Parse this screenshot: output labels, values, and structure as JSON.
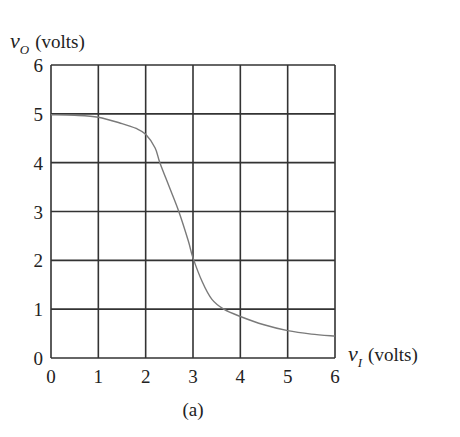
{
  "chart_data": {
    "type": "line",
    "title": "",
    "caption": "(a)",
    "xlabel": {
      "var": "v",
      "sub": "I",
      "unit": "(volts)"
    },
    "ylabel": {
      "var": "v",
      "sub": "O",
      "unit": "(volts)"
    },
    "xlim": [
      0,
      6
    ],
    "ylim": [
      0,
      6
    ],
    "xticks": [
      "0",
      "1",
      "2",
      "3",
      "4",
      "5",
      "6"
    ],
    "yticks": [
      "0",
      "1",
      "2",
      "3",
      "4",
      "5",
      "6"
    ],
    "grid": true,
    "legend": null,
    "series": [
      {
        "name": "v_O vs v_I",
        "color": "#7a7a7a",
        "x": [
          0.0,
          0.5,
          1.0,
          1.5,
          1.8,
          2.0,
          2.2,
          2.3,
          2.5,
          2.7,
          2.9,
          3.0,
          3.2,
          3.4,
          3.65,
          4.0,
          4.5,
          5.0,
          5.5,
          6.0
        ],
        "y": [
          4.98,
          4.97,
          4.93,
          4.8,
          4.7,
          4.58,
          4.3,
          4.0,
          3.5,
          3.0,
          2.4,
          2.05,
          1.55,
          1.2,
          1.0,
          0.85,
          0.68,
          0.56,
          0.49,
          0.45
        ]
      }
    ]
  }
}
